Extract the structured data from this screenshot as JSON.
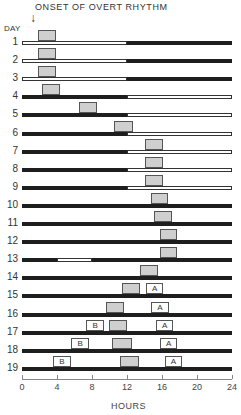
{
  "title": "ONSET OF OVERT RHYTHM",
  "arrow_glyph": "↓",
  "y_label": "DAY",
  "x_label": "HOURS",
  "axis": {
    "min": 0,
    "max": 24,
    "ticks": [
      0,
      4,
      8,
      12,
      16,
      20,
      24
    ],
    "x0_px": 22,
    "x24_px": 232
  },
  "legend_symbols": {
    "gray_box": "overt activity rhythm",
    "A": "A",
    "B": "B",
    "dark_bar": "dark",
    "white_bar": "light"
  },
  "days": [
    {
      "day": "1",
      "light": [
        [
          0,
          12
        ]
      ],
      "boxes": [
        {
          "type": "act",
          "start": 1.8,
          "end": 3.9
        }
      ]
    },
    {
      "day": "2",
      "light": [
        [
          0,
          12
        ]
      ],
      "boxes": [
        {
          "type": "act",
          "start": 1.8,
          "end": 3.9
        }
      ]
    },
    {
      "day": "3",
      "light": [
        [
          0,
          12
        ]
      ],
      "boxes": [
        {
          "type": "act",
          "start": 1.8,
          "end": 3.9
        }
      ]
    },
    {
      "day": "4",
      "light": [
        [
          12,
          24
        ]
      ],
      "boxes": [
        {
          "type": "act",
          "start": 2.3,
          "end": 4.3
        }
      ]
    },
    {
      "day": "5",
      "light": [
        [
          12,
          24
        ]
      ],
      "boxes": [
        {
          "type": "act",
          "start": 6.5,
          "end": 8.6
        }
      ]
    },
    {
      "day": "6",
      "light": [
        [
          12,
          24
        ]
      ],
      "boxes": [
        {
          "type": "act",
          "start": 10.5,
          "end": 12.7
        }
      ]
    },
    {
      "day": "7",
      "light": [
        [
          12,
          24
        ]
      ],
      "boxes": [
        {
          "type": "act",
          "start": 14.0,
          "end": 16.1
        }
      ]
    },
    {
      "day": "8",
      "light": [
        [
          12,
          24
        ]
      ],
      "boxes": [
        {
          "type": "act",
          "start": 14.0,
          "end": 16.1
        }
      ]
    },
    {
      "day": "9",
      "light": [
        [
          12,
          24
        ]
      ],
      "boxes": [
        {
          "type": "act",
          "start": 14.0,
          "end": 16.1
        }
      ]
    },
    {
      "day": "10",
      "light": [],
      "boxes": [
        {
          "type": "act",
          "start": 14.7,
          "end": 16.7
        }
      ]
    },
    {
      "day": "11",
      "light": [],
      "boxes": [
        {
          "type": "act",
          "start": 15.1,
          "end": 17.1
        }
      ]
    },
    {
      "day": "12",
      "light": [],
      "boxes": [
        {
          "type": "act",
          "start": 15.8,
          "end": 17.7
        }
      ]
    },
    {
      "day": "13",
      "light": [
        [
          4,
          8
        ]
      ],
      "boxes": [
        {
          "type": "act",
          "start": 15.8,
          "end": 17.7
        }
      ]
    },
    {
      "day": "14",
      "light": [],
      "boxes": [
        {
          "type": "act",
          "start": 13.5,
          "end": 15.5
        }
      ]
    },
    {
      "day": "15",
      "light": [],
      "boxes": [
        {
          "type": "act",
          "start": 11.4,
          "end": 13.5
        },
        {
          "type": "lbl",
          "label": "A",
          "start": 14.2,
          "end": 16.1
        }
      ]
    },
    {
      "day": "16",
      "light": [],
      "boxes": [
        {
          "type": "act",
          "start": 9.6,
          "end": 11.7
        },
        {
          "type": "lbl",
          "label": "A",
          "start": 14.7,
          "end": 16.8
        }
      ]
    },
    {
      "day": "17",
      "light": [],
      "boxes": [
        {
          "type": "lbl",
          "label": "B",
          "start": 7.3,
          "end": 9.4
        },
        {
          "type": "act",
          "start": 9.9,
          "end": 12.0
        },
        {
          "type": "lbl",
          "label": "A",
          "start": 15.3,
          "end": 17.3
        }
      ]
    },
    {
      "day": "18",
      "light": [],
      "boxes": [
        {
          "type": "lbl",
          "label": "B",
          "start": 5.6,
          "end": 7.7
        },
        {
          "type": "act",
          "start": 10.3,
          "end": 12.6
        },
        {
          "type": "lbl",
          "label": "A",
          "start": 15.8,
          "end": 17.7
        }
      ]
    },
    {
      "day": "19",
      "light": [],
      "boxes": [
        {
          "type": "lbl",
          "label": "B",
          "start": 3.5,
          "end": 5.6
        },
        {
          "type": "act",
          "start": 11.2,
          "end": 13.4
        },
        {
          "type": "lbl",
          "label": "A",
          "start": 16.3,
          "end": 18.3
        }
      ]
    }
  ]
}
